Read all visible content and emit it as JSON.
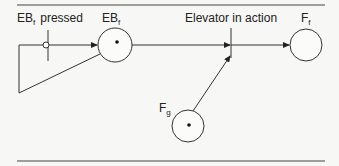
{
  "diagram": {
    "type": "petri-net",
    "places": [
      {
        "id": "EBf",
        "label": "EB",
        "subscript": "f",
        "tokens": 1
      },
      {
        "id": "Ff",
        "label": "F",
        "subscript": "f",
        "tokens": 0
      },
      {
        "id": "Fg",
        "label": "F",
        "subscript": "g",
        "tokens": 1
      }
    ],
    "transitions": [
      {
        "id": "t1",
        "label_main": "EB",
        "label_sub": "f",
        "label_rest": "pressed",
        "has_inhibitor_arc": true
      },
      {
        "id": "t2",
        "label": "Elevator in action"
      }
    ],
    "arcs": [
      {
        "from": "t1",
        "to": "EBf"
      },
      {
        "from": "EBf",
        "to": "t1",
        "type": "inhibitor-feedback"
      },
      {
        "from": "EBf",
        "to": "t2"
      },
      {
        "from": "Fg",
        "to": "t2"
      },
      {
        "from": "t2",
        "to": "Ff"
      }
    ],
    "colors": {
      "stroke": "#333333",
      "background": "#f7f7f5"
    }
  }
}
